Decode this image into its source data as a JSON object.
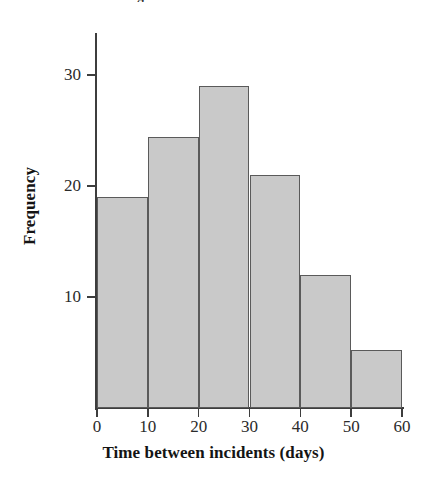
{
  "figure": {
    "clipped_title": "Histogram of Time between incidents",
    "background_color": "#ffffff"
  },
  "chart_data": {
    "type": "bar",
    "title": "",
    "xlabel": "Time between incidents (days)",
    "ylabel": "Frequency",
    "categories": [
      "0-10",
      "10-20",
      "20-30",
      "30-40",
      "40-50",
      "50-60"
    ],
    "bin_edges": [
      0,
      10,
      20,
      30,
      40,
      50,
      60
    ],
    "bin_width": 10,
    "values": [
      19,
      24.4,
      29,
      21,
      12,
      5.2
    ],
    "bar_fill_color": "#c9c9c9",
    "bar_edge_color": "#5a5a5a",
    "xlim": [
      0,
      60
    ],
    "ylim": [
      0,
      34
    ],
    "xticks": [
      0,
      10,
      20,
      30,
      40,
      50,
      60
    ],
    "xtick_labels": [
      "0",
      "10",
      "20",
      "30",
      "40",
      "50",
      "60"
    ],
    "yticks": [
      10,
      20,
      30
    ],
    "ytick_labels": [
      "10",
      "20",
      "30"
    ],
    "grid": false,
    "legend": null
  }
}
